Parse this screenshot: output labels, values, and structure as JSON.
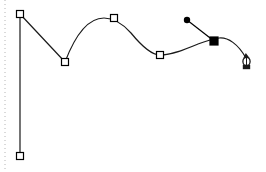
{
  "app": {
    "title": "Pen Tool Path Editing Canvas",
    "tool": "pen-tool",
    "canvas_width": 266,
    "canvas_height": 172,
    "background_color": "#ffffff",
    "stroke_color": "#1a1a1a",
    "anchor_fill_unselected": "#ffffff",
    "anchor_fill_selected": "#000000",
    "anchor_stroke": "#000000",
    "guide_color": "#b4b4b4",
    "handle_color": "#000000"
  },
  "guide": {
    "name": "vertical-dotted-guide",
    "x": 5,
    "y1": 0,
    "y2": 172,
    "dash": "1 3",
    "color": "#b4b4b4",
    "width": 1
  },
  "path": {
    "label": "bezier-path",
    "stroke_width": 1.2,
    "fill": "none",
    "d": "M 20 14 L 20 156 M 20 14 L 65 62 C 73 41 86 18 104 18 C 113 18 123 24 131 33 C 140 44 151 55 160 55 C 172 55 186 49 198 44 C 206 41 213 39 219 38 C 228 37 238 44 246 58",
    "segments": [
      {
        "name": "vertical-stem",
        "from": [
          20,
          14
        ],
        "to": [
          20,
          156
        ],
        "type": "line"
      },
      {
        "name": "descending-line",
        "from": [
          20,
          14
        ],
        "to": [
          65,
          62
        ],
        "type": "line"
      },
      {
        "name": "left-arch-rise",
        "from": [
          65,
          62
        ],
        "to": [
          114,
          18
        ],
        "type": "curve"
      },
      {
        "name": "right-arch-fall",
        "from": [
          114,
          18
        ],
        "to": [
          160,
          55
        ],
        "type": "curve"
      },
      {
        "name": "trailing-curve",
        "from": [
          160,
          55
        ],
        "to": [
          219,
          38
        ],
        "type": "curve"
      },
      {
        "name": "active-segment",
        "from": [
          219,
          38
        ],
        "to": [
          246,
          58
        ],
        "type": "curve"
      }
    ]
  },
  "anchors": [
    {
      "id": "anchor-1",
      "label": "Anchor 1 (top left)",
      "x": 20,
      "y": 14,
      "state": "unselected",
      "shape": "hollow-square",
      "size": 7
    },
    {
      "id": "anchor-2",
      "label": "Anchor 2 (bottom left)",
      "x": 20,
      "y": 156,
      "state": "unselected",
      "shape": "hollow-square",
      "size": 7
    },
    {
      "id": "anchor-3",
      "label": "Anchor 3 (valley)",
      "x": 65,
      "y": 62,
      "state": "unselected",
      "shape": "hollow-square",
      "size": 7
    },
    {
      "id": "anchor-4",
      "label": "Anchor 4 (arch peak)",
      "x": 114,
      "y": 18,
      "state": "unselected",
      "shape": "hollow-square",
      "size": 7
    },
    {
      "id": "anchor-5",
      "label": "Anchor 5 (right valley)",
      "x": 160,
      "y": 55,
      "state": "unselected",
      "shape": "hollow-square",
      "size": 7
    },
    {
      "id": "anchor-6",
      "label": "Anchor 6 (selected)",
      "x": 214,
      "y": 41,
      "state": "selected",
      "shape": "filled-square",
      "size": 8
    }
  ],
  "direction_handle": {
    "label": "Direction handle for selected anchor",
    "anchor_x": 214,
    "anchor_y": 41,
    "handle_x": 187,
    "handle_y": 20,
    "handle_radius": 3.2,
    "line_width": 1.2,
    "state": "active"
  },
  "cursor": {
    "label": "Pen tool cursor (close path)",
    "name": "pen-nib-cursor",
    "hotspot_x": 247,
    "hotspot_y": 53,
    "body_x": 248,
    "body_y": 66,
    "indicator": "circle"
  }
}
